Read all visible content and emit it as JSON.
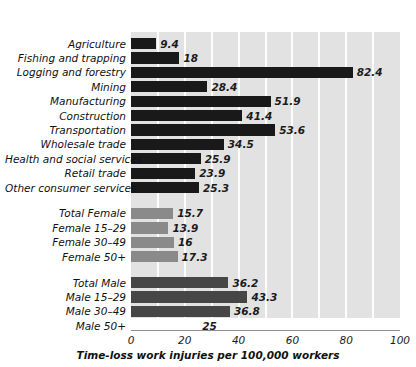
{
  "chart_data": {
    "type": "bar",
    "orientation": "horizontal",
    "title": "",
    "xlabel": "Time-loss work injuries per 100,000 workers",
    "ylabel": "",
    "xlim": [
      0,
      100
    ],
    "xticks": [
      0,
      20,
      40,
      60,
      80,
      100
    ],
    "xtick_labels": [
      "0",
      "20",
      "40",
      "60",
      "80",
      "100"
    ],
    "grid": "vertical gridlines every 10 units, white on light gray plot background",
    "legend": "none",
    "groups": [
      {
        "name": "industry",
        "color": "#191919",
        "categories": [
          "Agriculture",
          "Fishing and trapping",
          "Logging and forestry",
          "Mining",
          "Manufacturing",
          "Construction",
          "Transportation",
          "Wholesale trade",
          "Health and social services",
          "Retail trade",
          "Other consumer services"
        ],
        "values": [
          9.4,
          18,
          82.4,
          28.4,
          51.9,
          41.4,
          53.6,
          34.5,
          25.9,
          23.9,
          25.3
        ],
        "value_labels": [
          "9.4",
          "18",
          "82.4",
          "28.4",
          "51.9",
          "41.4",
          "53.6",
          "34.5",
          "25.9",
          "23.9",
          "25.3"
        ]
      },
      {
        "name": "female",
        "color": "#8a8a8a",
        "categories": [
          "Total Female",
          "Female 15–29",
          "Female 30–49",
          "Female 50+"
        ],
        "values": [
          15.7,
          13.9,
          16,
          17.3
        ],
        "value_labels": [
          "15.7",
          "13.9",
          "16",
          "17.3"
        ]
      },
      {
        "name": "male",
        "color": "#464646",
        "categories": [
          "Total Male",
          "Male 15–29",
          "Male 30–49",
          "Male 50+"
        ],
        "values": [
          36.2,
          43.3,
          36.8,
          25
        ],
        "value_labels": [
          "36.2",
          "43.3",
          "36.8",
          "25"
        ]
      }
    ]
  }
}
